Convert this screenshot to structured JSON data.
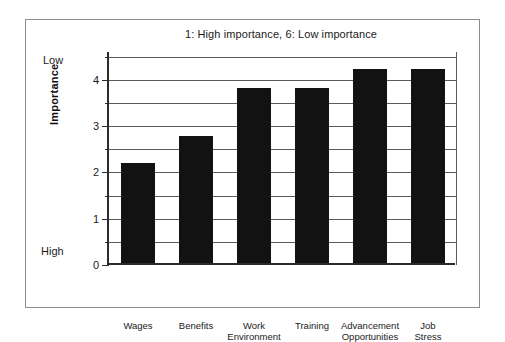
{
  "figure": {
    "background_color": "#ffffff",
    "frame_color": "#8d8d8d"
  },
  "chart_data": {
    "type": "bar",
    "title": "1: High importance, 6: Low importance",
    "xlabel": "",
    "ylabel": "Importance",
    "categories": [
      "Wages",
      "Benefits",
      "Work Environment",
      "Training",
      "Advancement Opportunities",
      "Job Stress"
    ],
    "values": [
      2.15,
      2.75,
      3.78,
      3.78,
      4.2,
      4.2
    ],
    "ylim": [
      0,
      4.6
    ],
    "ytick_labels": [
      "0",
      "1",
      "2",
      "3",
      "4"
    ],
    "ytick_values": [
      0,
      1,
      2,
      3,
      4
    ],
    "minor_tick_interval": 0.5,
    "grid": true,
    "grid_axis": "y",
    "legend": false,
    "bar_color": "#121212",
    "axis_annotations": {
      "top": "Low",
      "bottom": "High"
    }
  },
  "axis": {
    "y_title": "Importance",
    "low_label": "Low",
    "high_label": "High",
    "ticks": [
      {
        "label": "4",
        "value": 4
      },
      {
        "label": "3",
        "value": 3
      },
      {
        "label": "2",
        "value": 2
      },
      {
        "label": "1",
        "value": 1
      },
      {
        "label": "0",
        "value": 0
      }
    ]
  },
  "categories": [
    {
      "line1": "Wages",
      "line2": ""
    },
    {
      "line1": "Benefits",
      "line2": ""
    },
    {
      "line1": "Work",
      "line2": "Environment"
    },
    {
      "line1": "Training",
      "line2": ""
    },
    {
      "line1": "Advancement",
      "line2": "Opportunities"
    },
    {
      "line1": "Job",
      "line2": "Stress"
    }
  ]
}
